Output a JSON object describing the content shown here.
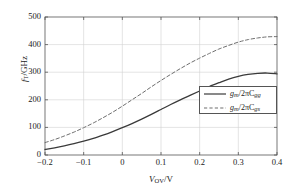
{
  "chart_data": {
    "type": "line",
    "title": "",
    "xlabel": "V_OV/V",
    "ylabel": "f_T/GHz",
    "xlabel_parts": {
      "main": "V",
      "sub": "OV",
      "tail": "/V"
    },
    "ylabel_parts": {
      "main": "f",
      "sub": "T",
      "tail": "/GHz"
    },
    "xlim": [
      -0.2,
      0.4
    ],
    "ylim": [
      0,
      500
    ],
    "xticks": [
      "−0.2",
      "−0.1",
      "0",
      "0.1",
      "0.2",
      "0.3",
      "0.4"
    ],
    "xtick_values": [
      -0.2,
      -0.1,
      0,
      0.1,
      0.2,
      0.3,
      0.4
    ],
    "yticks": [
      "0",
      "100",
      "200",
      "300",
      "400",
      "500"
    ],
    "ytick_values": [
      0,
      100,
      200,
      300,
      400,
      500
    ],
    "grid": true,
    "legend_position": "lower right",
    "x": [
      -0.2,
      -0.175,
      -0.15,
      -0.125,
      -0.1,
      -0.075,
      -0.05,
      -0.025,
      0,
      0.025,
      0.05,
      0.075,
      0.1,
      0.125,
      0.15,
      0.175,
      0.2,
      0.225,
      0.25,
      0.275,
      0.3,
      0.325,
      0.35,
      0.375,
      0.4
    ],
    "series": [
      {
        "name": "gm_over_2piCgg",
        "style": "solid",
        "color": "#3a3a3a",
        "values": [
          20,
          26,
          33,
          41,
          50,
          60,
          72,
          85,
          99,
          114,
          130,
          147,
          165,
          183,
          200,
          216,
          232,
          248,
          262,
          275,
          285,
          292,
          296,
          297,
          294
        ]
      },
      {
        "name": "gm_over_2piCgs",
        "style": "dashed",
        "color": "#6e6e6e",
        "values": [
          45,
          56,
          69,
          83,
          99,
          116,
          135,
          155,
          177,
          200,
          223,
          247,
          270,
          292,
          313,
          333,
          351,
          368,
          384,
          397,
          409,
          418,
          424,
          428,
          429
        ]
      }
    ],
    "legend": [
      {
        "style": "solid",
        "num": "g",
        "num_sub": "m",
        "den": "/2πC",
        "den_sub": "gg"
      },
      {
        "style": "dashed",
        "num": "g",
        "num_sub": "m",
        "den": "/2πC",
        "den_sub": "gs"
      }
    ]
  }
}
